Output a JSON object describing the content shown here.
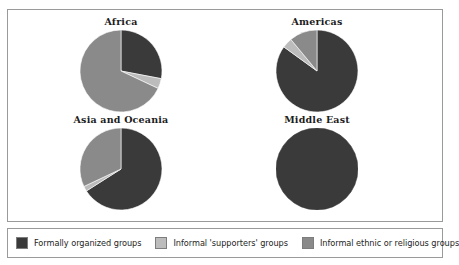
{
  "figure": {
    "background_color": "#ffffff",
    "border_color": "#9a9a9a"
  },
  "palette": {
    "formally_organized": "#3a3a3a",
    "informal_supporters": "#bcbcbc",
    "informal_ethnic_religious": "#8a8a8a"
  },
  "legend": {
    "items": [
      {
        "label": "Formally organized groups",
        "color": "#3a3a3a",
        "key": "formally_organized"
      },
      {
        "label": "Informal 'supporters' groups",
        "color": "#bcbcbc",
        "key": "informal_supporters"
      },
      {
        "label": "Informal ethnic or religious groups",
        "color": "#8a8a8a",
        "key": "informal_ethnic_religious"
      }
    ]
  },
  "chart_data": {
    "type": "pie",
    "title": "",
    "subtitle": "",
    "xlabel": "",
    "ylabel": "",
    "grid": false,
    "legend_position": "bottom",
    "start_angle_deg": 90,
    "direction": "clockwise",
    "categories": [
      "Formally organized groups",
      "Informal 'supporters' groups",
      "Informal ethnic or religious groups"
    ],
    "colors": [
      "#3a3a3a",
      "#bcbcbc",
      "#8a8a8a"
    ],
    "panels": [
      {
        "title": "Africa",
        "values": [
          28,
          4,
          68
        ],
        "unit": "%",
        "slices": [
          {
            "name": "Formally organized groups",
            "value": 28,
            "color": "#3a3a3a"
          },
          {
            "name": "Informal 'supporters' groups",
            "value": 4,
            "color": "#bcbcbc"
          },
          {
            "name": "Informal ethnic or religious groups",
            "value": 68,
            "color": "#8a8a8a"
          }
        ]
      },
      {
        "title": "Americas",
        "values": [
          85,
          4,
          11
        ],
        "unit": "%",
        "slices": [
          {
            "name": "Formally organized groups",
            "value": 85,
            "color": "#3a3a3a"
          },
          {
            "name": "Informal 'supporters' groups",
            "value": 4,
            "color": "#bcbcbc"
          },
          {
            "name": "Informal ethnic or religious groups",
            "value": 11,
            "color": "#8a8a8a"
          }
        ]
      },
      {
        "title": "Asia and Oceania",
        "values": [
          66,
          2,
          32
        ],
        "unit": "%",
        "slices": [
          {
            "name": "Formally organized groups",
            "value": 66,
            "color": "#3a3a3a"
          },
          {
            "name": "Informal 'supporters' groups",
            "value": 2,
            "color": "#bcbcbc"
          },
          {
            "name": "Informal ethnic or religious groups",
            "value": 32,
            "color": "#8a8a8a"
          }
        ]
      },
      {
        "title": "Middle East",
        "values": [
          100,
          0,
          0
        ],
        "unit": "%",
        "slices": [
          {
            "name": "Formally organized groups",
            "value": 100,
            "color": "#3a3a3a"
          },
          {
            "name": "Informal 'supporters' groups",
            "value": 0,
            "color": "#bcbcbc"
          },
          {
            "name": "Informal ethnic or religious groups",
            "value": 0,
            "color": "#8a8a8a"
          }
        ]
      }
    ]
  }
}
